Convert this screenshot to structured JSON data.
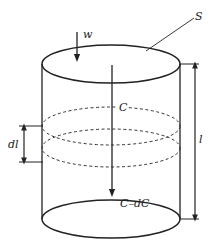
{
  "diagram": {
    "type": "cylinder-element",
    "labels": {
      "surface": "S",
      "flux": "w",
      "concentration_top": "C",
      "concentration_bottom": "C–dC",
      "element_length": "dl",
      "total_length": "l"
    },
    "colors": {
      "stroke": "#222222",
      "background": "#ffffff"
    }
  }
}
